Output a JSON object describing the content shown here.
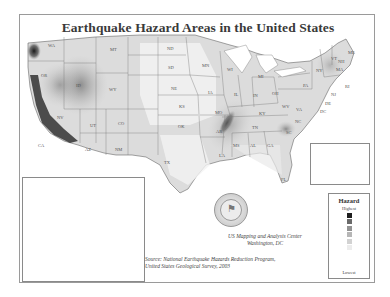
{
  "title": "Earthquake Hazard Areas in the United States",
  "states": [
    {
      "abbr": "WA",
      "x": 28,
      "y": 28
    },
    {
      "abbr": "OR",
      "x": 21,
      "y": 58
    },
    {
      "abbr": "ID",
      "x": 56,
      "y": 68
    },
    {
      "abbr": "MT",
      "x": 90,
      "y": 32
    },
    {
      "abbr": "WY",
      "x": 89,
      "y": 72
    },
    {
      "abbr": "NV",
      "x": 37,
      "y": 100
    },
    {
      "abbr": "UT",
      "x": 70,
      "y": 108
    },
    {
      "abbr": "CO",
      "x": 98,
      "y": 106
    },
    {
      "abbr": "CA",
      "x": 18,
      "y": 128
    },
    {
      "abbr": "AZ",
      "x": 65,
      "y": 132
    },
    {
      "abbr": "NM",
      "x": 95,
      "y": 132
    },
    {
      "abbr": "ND",
      "x": 147,
      "y": 31
    },
    {
      "abbr": "SD",
      "x": 148,
      "y": 50
    },
    {
      "abbr": "NE",
      "x": 151,
      "y": 71
    },
    {
      "abbr": "KS",
      "x": 159,
      "y": 89
    },
    {
      "abbr": "OK",
      "x": 158,
      "y": 109
    },
    {
      "abbr": "TX",
      "x": 144,
      "y": 145
    },
    {
      "abbr": "MN",
      "x": 182,
      "y": 48
    },
    {
      "abbr": "IA",
      "x": 188,
      "y": 75
    },
    {
      "abbr": "MO",
      "x": 195,
      "y": 95
    },
    {
      "abbr": "AR",
      "x": 196,
      "y": 114
    },
    {
      "abbr": "LA",
      "x": 199,
      "y": 138
    },
    {
      "abbr": "WI",
      "x": 207,
      "y": 52
    },
    {
      "abbr": "IL",
      "x": 214,
      "y": 77
    },
    {
      "abbr": "MI",
      "x": 238,
      "y": 59
    },
    {
      "abbr": "IN",
      "x": 233,
      "y": 78
    },
    {
      "abbr": "OH",
      "x": 252,
      "y": 76
    },
    {
      "abbr": "KY",
      "x": 239,
      "y": 96
    },
    {
      "abbr": "TN",
      "x": 232,
      "y": 110
    },
    {
      "abbr": "MS",
      "x": 213,
      "y": 128
    },
    {
      "abbr": "AL",
      "x": 230,
      "y": 128
    },
    {
      "abbr": "GA",
      "x": 247,
      "y": 128
    },
    {
      "abbr": "FL",
      "x": 261,
      "y": 162
    },
    {
      "abbr": "SC",
      "x": 266,
      "y": 115
    },
    {
      "abbr": "NC",
      "x": 275,
      "y": 104
    },
    {
      "abbr": "VA",
      "x": 276,
      "y": 92
    },
    {
      "abbr": "WV",
      "x": 262,
      "y": 89
    },
    {
      "abbr": "PA",
      "x": 283,
      "y": 68
    },
    {
      "abbr": "NY",
      "x": 296,
      "y": 53
    },
    {
      "abbr": "NJ",
      "x": 311,
      "y": 77
    },
    {
      "abbr": "DE",
      "x": 305,
      "y": 86
    },
    {
      "abbr": "DC",
      "x": 300,
      "y": 94
    },
    {
      "abbr": "VT",
      "x": 311,
      "y": 41
    },
    {
      "abbr": "NH",
      "x": 318,
      "y": 44
    },
    {
      "abbr": "ME",
      "x": 328,
      "y": 35
    },
    {
      "abbr": "MA",
      "x": 316,
      "y": 52
    },
    {
      "abbr": "RI",
      "x": 325,
      "y": 69
    },
    {
      "abbr": "AK",
      "x": 62,
      "y": 193
    },
    {
      "abbr": "HI",
      "x": 338,
      "y": 157
    }
  ],
  "legend": {
    "title": "Hazard",
    "high_label": "Highest",
    "low_label": "Lowest",
    "colors": [
      "#1e1e1e",
      "#6a6a6a",
      "#939393",
      "#b6b6b6",
      "#d2d2d2",
      "#ececec"
    ]
  },
  "credit": {
    "line1": "US Mapping and Analysis Center",
    "line2": "Washington, DC"
  },
  "source": {
    "line1": "Source: National Earthquake Hazards Reduction Program,",
    "line2": "United States Geological Survey, 2003"
  }
}
